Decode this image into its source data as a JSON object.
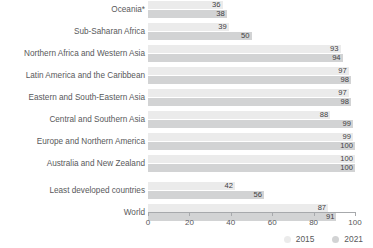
{
  "chart_data": {
    "type": "bar",
    "orientation": "horizontal",
    "title": "",
    "subtitle": "",
    "xlabel": "",
    "ylabel": "",
    "xlim": [
      0,
      100
    ],
    "xticks": [
      0,
      20,
      40,
      60,
      80,
      100
    ],
    "grid": false,
    "legend_position": "bottom-right",
    "categories": [
      "Oceania*",
      "Sub-Saharan Africa",
      "Northern Africa and Western Asia",
      "Latin America and the Caribbean",
      "Eastern and South-Eastern Asia",
      "Central and Southern Asia",
      "Europe and Northern America",
      "Australia and New Zealand",
      "Least developed countries",
      "World"
    ],
    "series": [
      {
        "name": "2015",
        "color": "#ebebeb",
        "values": [
          36,
          39,
          93,
          97,
          97,
          88,
          99,
          100,
          42,
          87
        ]
      },
      {
        "name": "2021",
        "color": "#d2d3d4",
        "values": [
          38,
          50,
          94,
          98,
          98,
          99,
          100,
          100,
          56,
          91
        ]
      }
    ]
  },
  "rows": [
    {
      "label": "Oceania*",
      "v2015": 36,
      "v2021": 38,
      "spaced": false
    },
    {
      "label": "Sub-Saharan Africa",
      "v2015": 39,
      "v2021": 50,
      "spaced": false
    },
    {
      "label": "Northern Africa and Western Asia",
      "v2015": 93,
      "v2021": 94,
      "spaced": false
    },
    {
      "label": "Latin America and the Caribbean",
      "v2015": 97,
      "v2021": 98,
      "spaced": false
    },
    {
      "label": "Eastern and South-Eastern Asia",
      "v2015": 97,
      "v2021": 98,
      "spaced": false
    },
    {
      "label": "Central and Southern Asia",
      "v2015": 88,
      "v2021": 99,
      "spaced": false
    },
    {
      "label": "Europe and Northern America",
      "v2015": 99,
      "v2021": 100,
      "spaced": false
    },
    {
      "label": "Australia and New Zealand",
      "v2015": 100,
      "v2021": 100,
      "spaced": false
    },
    {
      "label": "Least developed countries",
      "v2015": 42,
      "v2021": 56,
      "spaced": true
    },
    {
      "label": "World",
      "v2015": 87,
      "v2021": 91,
      "spaced": false
    }
  ],
  "axis": {
    "ticks": [
      "0",
      "20",
      "40",
      "60",
      "80",
      "100"
    ]
  },
  "legend": {
    "items": [
      {
        "label": "2015",
        "color": "#ebebeb"
      },
      {
        "label": "2021",
        "color": "#d2d3d4"
      }
    ]
  }
}
